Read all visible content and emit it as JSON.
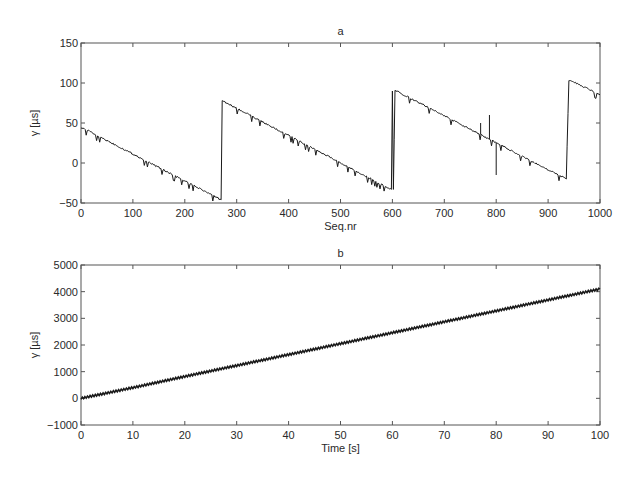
{
  "chart_data": [
    {
      "id": "a",
      "type": "line",
      "title": "a",
      "xlabel": "Seq.nr",
      "ylabel": "γ [µs]",
      "xlim": [
        0,
        1000
      ],
      "ylim": [
        -50,
        150
      ],
      "xticks": [
        0,
        100,
        200,
        300,
        400,
        500,
        600,
        700,
        800,
        900,
        1000
      ],
      "yticks": [
        -50,
        0,
        50,
        100,
        150
      ],
      "grid": false,
      "legend": null,
      "series": [
        {
          "name": "offset",
          "description": "sawtooth: linear decline with periodic upward resets",
          "x": [
            0,
            270,
            272,
            275,
            598,
            600,
            602,
            605,
            935,
            940,
            945,
            1000
          ],
          "y": [
            45,
            -46,
            78,
            77,
            -33,
            90,
            -33,
            91,
            -20,
            103,
            103,
            85
          ]
        }
      ],
      "spikes": [
        {
          "x": 770,
          "y": 50
        },
        {
          "x": 787,
          "y": 60
        },
        {
          "x": 800,
          "y": -15
        }
      ]
    },
    {
      "id": "b",
      "type": "line",
      "title": "b",
      "xlabel": "Time [s]",
      "ylabel": "γ [µs]",
      "xlim": [
        0,
        100
      ],
      "ylim": [
        -1000,
        5000
      ],
      "xticks": [
        0,
        10,
        20,
        30,
        40,
        50,
        60,
        70,
        80,
        90,
        100
      ],
      "yticks": [
        -1000,
        0,
        1000,
        2000,
        3000,
        4000,
        5000
      ],
      "grid": false,
      "legend": null,
      "series": [
        {
          "name": "offset",
          "x": [
            0,
            10,
            20,
            30,
            40,
            50,
            60,
            70,
            80,
            90,
            100
          ],
          "y": [
            0,
            400,
            820,
            1230,
            1640,
            2050,
            2460,
            2870,
            3280,
            3690,
            4100
          ]
        }
      ]
    }
  ]
}
